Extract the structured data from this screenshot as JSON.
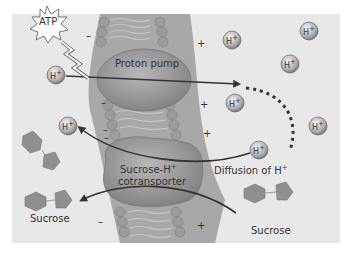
{
  "diagram": {
    "atp_label": "ATP",
    "proton_pump_label": "Proton pump",
    "cotransporter_label_line1": "Sucrose-H",
    "cotransporter_label_sup": "+",
    "cotransporter_label_line2": "cotransporter",
    "diffusion_label": "Diffusion of H",
    "diffusion_label_sup": "+",
    "sucrose_left_label": "Sucrose",
    "sucrose_right_label": "Sucrose",
    "ion_label": "H",
    "ion_sup": "+",
    "charge_negative": "–",
    "charge_positive": "+",
    "colors": {
      "background": "#e8e8e8",
      "membrane": "#9a9a9a",
      "protein": "#8c8c8c",
      "sucrose": "#8f8f8f",
      "arrow": "#333333"
    }
  }
}
